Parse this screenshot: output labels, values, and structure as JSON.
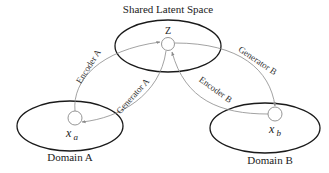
{
  "diagram": {
    "title": "Shared Latent Space",
    "latent_node": {
      "label": "Z"
    },
    "domains": [
      {
        "label": "Domain A",
        "node_var": "x",
        "node_sub": "a"
      },
      {
        "label": "Domain B",
        "node_var": "x",
        "node_sub": "b"
      }
    ],
    "edges": [
      {
        "label": "Encoder A",
        "from": "x_a",
        "to": "Z"
      },
      {
        "label": "Generator A",
        "from": "Z",
        "to": "x_a"
      },
      {
        "label": "Encoder B",
        "from": "x_b",
        "to": "Z"
      },
      {
        "label": "Generator B",
        "from": "Z",
        "to": "x_b"
      }
    ],
    "colors": {
      "ellipse_stroke": "#1a1a1a",
      "arrow_stroke": "#8a8a8a",
      "background": "#ffffff"
    }
  }
}
